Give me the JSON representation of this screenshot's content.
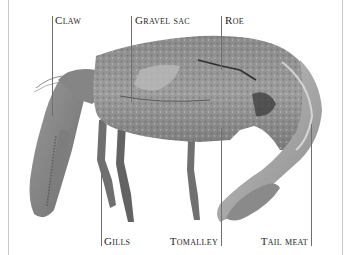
{
  "figure": {
    "labels": {
      "claw": "Claw",
      "gravel_sac": "Gravel sac",
      "roe": "Roe",
      "gills": "Gills",
      "tomalley": "Tomalley",
      "tail_meat": "Tail meat"
    },
    "colors": {
      "background": "#ffffff",
      "leader_line": "#6e6e6e",
      "frame_line": "#c9c9c9",
      "label_text": "#1e1e1e"
    }
  }
}
